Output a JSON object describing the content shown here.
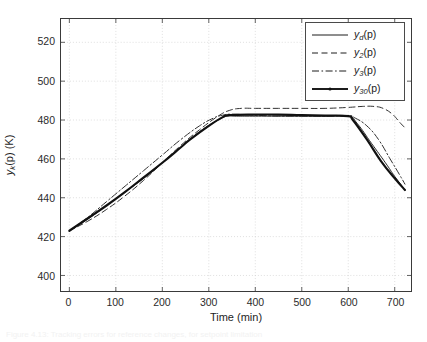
{
  "figure": {
    "background_color": "#ffffff",
    "axis_color": "#3a3a3a",
    "grid_color": "#c9c9c9",
    "caption": "Figure 4.13: Tracking errors for reference changes, for setpoint limitation"
  },
  "axes": {
    "xlabel": "Time (min)",
    "ylabel_main": "y",
    "ylabel_sub": "k",
    "ylabel_rest": "(p) (K)",
    "xticks": [
      "0",
      "100",
      "200",
      "300",
      "400",
      "500",
      "600",
      "700"
    ],
    "yticks": [
      "400",
      "420",
      "440",
      "460",
      "480",
      "500",
      "520"
    ]
  },
  "legend": {
    "position": "top-right",
    "entries": [
      {
        "name": "y",
        "sub": "d",
        "suffix": "(p)",
        "style": "solid",
        "width": 1,
        "marker": "none"
      },
      {
        "name": "y",
        "sub": "2",
        "suffix": "(p)",
        "style": "dashed",
        "width": 1,
        "marker": "none"
      },
      {
        "name": "y",
        "sub": "3",
        "suffix": "(p)",
        "style": "dashdot",
        "width": 1,
        "marker": "none"
      },
      {
        "name": "y",
        "sub": "30",
        "suffix": "(p)",
        "style": "solid",
        "width": 2.2,
        "marker": "dot"
      }
    ]
  },
  "chart_data": {
    "type": "line",
    "title": "",
    "xlabel": "Time (min)",
    "ylabel": "y_k(p) (K)",
    "xlim": [
      -18,
      735
    ],
    "ylim": [
      392,
      532
    ],
    "grid": true,
    "legend_position": "upper right",
    "xticks": [
      0,
      100,
      200,
      300,
      400,
      500,
      600,
      700
    ],
    "yticks": [
      400,
      420,
      440,
      460,
      480,
      500,
      520
    ],
    "series": [
      {
        "name": "y_d(p)",
        "style": "solid",
        "color": "#262626",
        "width": 1,
        "x": [
          0,
          40,
          80,
          120,
          160,
          200,
          240,
          280,
          320,
          340,
          360,
          400,
          450,
          500,
          550,
          600,
          620,
          650,
          680,
          700,
          722
        ],
        "y": [
          423,
          429,
          436,
          443,
          450,
          458,
          466,
          474,
          480,
          482,
          482,
          482,
          482,
          482,
          482,
          482,
          478,
          468,
          458,
          451,
          444
        ]
      },
      {
        "name": "y_2(p)",
        "style": "dashed",
        "color": "#303030",
        "width": 1,
        "x": [
          0,
          40,
          80,
          120,
          160,
          200,
          240,
          280,
          320,
          345,
          370,
          400,
          450,
          500,
          550,
          600,
          630,
          655,
          675,
          695,
          710,
          722
        ],
        "y": [
          423,
          428,
          434,
          441,
          449,
          458,
          467,
          475,
          482,
          485,
          486,
          486,
          486,
          486,
          486,
          486.5,
          487,
          487,
          486,
          483,
          479,
          476
        ]
      },
      {
        "name": "y_3(p)",
        "style": "dashdot",
        "color": "#303030",
        "width": 1,
        "x": [
          0,
          40,
          80,
          120,
          160,
          200,
          240,
          280,
          310,
          330,
          350,
          400,
          450,
          500,
          550,
          600,
          615,
          640,
          665,
          690,
          710,
          722
        ],
        "y": [
          423,
          430,
          438,
          446,
          454,
          462,
          470,
          477,
          481,
          482.5,
          483,
          482.5,
          482,
          482,
          482,
          482,
          481,
          477,
          470,
          460,
          452,
          447
        ]
      },
      {
        "name": "y_30(p)",
        "style": "solid",
        "color": "#111111",
        "width": 2.2,
        "x": [
          0,
          40,
          80,
          120,
          160,
          200,
          240,
          260,
          300,
          330,
          345,
          400,
          450,
          500,
          550,
          600,
          610,
          640,
          670,
          700,
          722
        ],
        "y": [
          423,
          429.5,
          436,
          443,
          450.5,
          458,
          466,
          470,
          477,
          481.5,
          482.5,
          482.8,
          482.8,
          482.5,
          482.3,
          482,
          480,
          470,
          459,
          450,
          444
        ]
      }
    ]
  }
}
